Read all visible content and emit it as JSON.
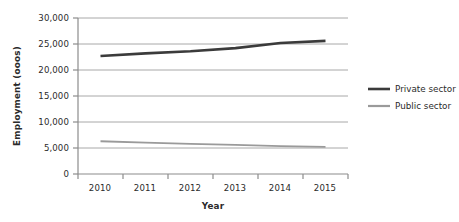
{
  "chart_data": {
    "type": "line",
    "title": "",
    "xlabel": "Year",
    "ylabel": "Employment (ooos)",
    "categories": [
      "2010",
      "2011",
      "2012",
      "2013",
      "2014",
      "2015"
    ],
    "x": [
      2010,
      2011,
      2012,
      2013,
      2014,
      2015
    ],
    "xlim": [
      2010,
      2015
    ],
    "ylim": [
      0,
      30000
    ],
    "ytick_values": [
      0,
      5000,
      10000,
      15000,
      20000,
      25000,
      30000
    ],
    "ytick_labels": [
      "0",
      "5,000",
      "10,000",
      "15,000",
      "20,000",
      "25,000",
      "30,000"
    ],
    "grid": "horizontal",
    "legend_position": "right",
    "series": [
      {
        "name": "Private sector",
        "color": "#3b3b3b",
        "line_width": 2.6,
        "values": [
          22700,
          23200,
          23600,
          24200,
          25200,
          25600
        ]
      },
      {
        "name": "Public sector",
        "color": "#9a9a9a",
        "line_width": 1.8,
        "values": [
          6300,
          6050,
          5800,
          5600,
          5350,
          5200
        ]
      }
    ]
  },
  "axes": {
    "y_title": "Employment (ooos)",
    "x_title": "Year",
    "y_ticks": [
      "30,000",
      "25,000",
      "20,000",
      "15,000",
      "10,000",
      "5,000",
      "0"
    ],
    "x_ticks": [
      "2010",
      "2011",
      "2012",
      "2013",
      "2014",
      "2015"
    ]
  },
  "legend": {
    "items": [
      {
        "label": "Private sector",
        "color": "#3b3b3b"
      },
      {
        "label": "Public sector",
        "color": "#9a9a9a"
      }
    ]
  },
  "colors": {
    "private": "#3b3b3b",
    "public": "#9a9a9a",
    "gridline": "#a8a8a8",
    "axis": "#8c8c8c",
    "background": "#ffffff"
  }
}
